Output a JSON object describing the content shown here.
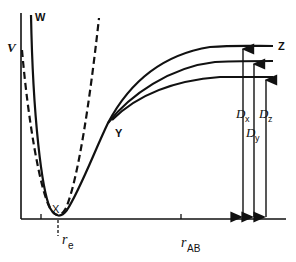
{
  "figure": {
    "y_axis_label": "V",
    "x_axis_label": "r",
    "x_axis_label_sub": "AB",
    "equilibrium_label": "r",
    "equilibrium_label_sub": "e",
    "point_labels": {
      "w": "W",
      "x": "X",
      "y": "Y",
      "z": "Z"
    },
    "dissociation_labels": [
      {
        "main": "D",
        "sub": "x"
      },
      {
        "main": "D",
        "sub": "y"
      },
      {
        "main": "D",
        "sub": "z"
      }
    ],
    "curves": [
      {
        "name": "harmonic-parabola",
        "style": "dashed"
      },
      {
        "name": "morse-curve-x",
        "style": "solid"
      },
      {
        "name": "morse-curve-y",
        "style": "solid"
      },
      {
        "name": "morse-curve-z",
        "style": "solid"
      }
    ],
    "colors": {
      "ink": "#111111",
      "background": "#ffffff"
    }
  }
}
